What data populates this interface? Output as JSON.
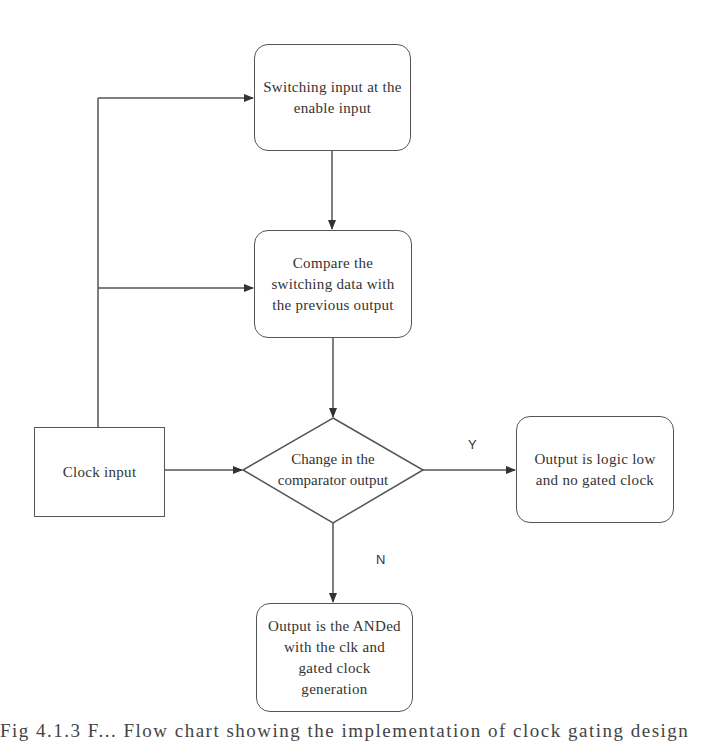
{
  "diagram": {
    "type": "flowchart",
    "nodes": {
      "switching_input": {
        "label": "Switching input at the enable input",
        "lines": [
          "Switching input at",
          "the enable input"
        ]
      },
      "compare": {
        "label": "Compare the switching data with the previous output",
        "lines": [
          "Compare the",
          "switching data with",
          "the previous output"
        ]
      },
      "clock_input": {
        "label": "Clock input",
        "lines": [
          "Clock input"
        ]
      },
      "decision": {
        "label": "Change in the comparator output",
        "lines": [
          "Change in the",
          "comparator output"
        ]
      },
      "output_low": {
        "label": "Output is logic low and no gated clock",
        "lines": [
          "Output is logic low",
          "and no gated clock"
        ]
      },
      "output_anded": {
        "label": "Output is the ANDed with the clk and gated clock generation",
        "lines": [
          "Output is the",
          "ANDed with the clk",
          "and gated clock",
          "generation"
        ]
      }
    },
    "edges": [
      {
        "from": "clock_input",
        "to": "switching_input",
        "label": ""
      },
      {
        "from": "clock_input",
        "to": "compare",
        "label": ""
      },
      {
        "from": "clock_input",
        "to": "decision",
        "label": ""
      },
      {
        "from": "switching_input",
        "to": "compare",
        "label": ""
      },
      {
        "from": "compare",
        "to": "decision",
        "label": ""
      },
      {
        "from": "decision",
        "to": "output_low",
        "label": "Y"
      },
      {
        "from": "decision",
        "to": "output_anded",
        "label": "N"
      }
    ],
    "edge_labels": {
      "yes": "Y",
      "no": "N"
    }
  },
  "caption": "Fig 4.1.3 F... Flow chart showing the implementation of clock gating design"
}
